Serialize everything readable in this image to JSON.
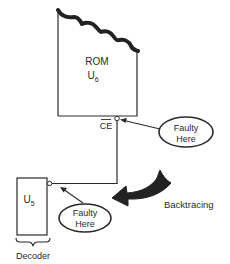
{
  "diagram": {
    "rom": {
      "label": "ROM",
      "ref": "U",
      "ref_sub": "6"
    },
    "ce_label": "CE",
    "decoder": {
      "ref": "U",
      "ref_sub": "5",
      "label": "Decoder"
    },
    "callouts": [
      {
        "line1": "Faulty",
        "line2": "Here"
      },
      {
        "line1": "Faulty",
        "line2": "Here"
      }
    ],
    "backtrace_label": "Backtracing",
    "colors": {
      "stroke": "#2a2a2a",
      "background": "#ffffff"
    }
  }
}
